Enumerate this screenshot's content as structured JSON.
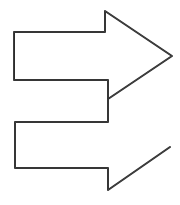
{
  "image": {
    "title": "Double right-pointing arrow sketch",
    "style": "hand-drawn outline",
    "background_color": "#ffffff",
    "stroke_color": "#2b2b2b",
    "stroke_width": 2,
    "width": 180,
    "height": 205,
    "shape_count": 2
  },
  "shapes": [
    {
      "name": "upper-arrow",
      "label": "Upper right-pointing arrow",
      "direction": "right",
      "fill": "none",
      "stroke_color": "#2b2b2b",
      "points": "14,32 105,32 105,11 172,56 108,99 108,80 14,80"
    },
    {
      "name": "lower-arrow",
      "label": "Lower right-pointing arrow",
      "direction": "right",
      "fill": "none",
      "stroke_color": "#2b2b2b",
      "points": "108,99 108,122 15,122 15,168 108,168 108,190 170,147"
    }
  ]
}
